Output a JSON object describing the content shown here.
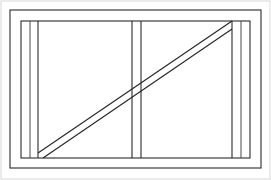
{
  "figure": {
    "title": "Braced rectangular frame elevation",
    "caption": "",
    "type": "line-drawing",
    "background_color": "#ffffff",
    "line_color": "#2b2b2b",
    "soft_line_color": "#4a4a4a",
    "page_border_color": "#d8d8d8",
    "canvas": {
      "width": 271,
      "height": 180
    }
  },
  "geometry": {
    "page_border": {
      "x": 1,
      "y": 1,
      "width": 269,
      "height": 178
    },
    "outer_frame": {
      "x": 10,
      "y": 10,
      "width": 251,
      "height": 158
    },
    "inner_frame": {
      "x": 21,
      "y": 21,
      "width": 229,
      "height": 137
    },
    "left_stud": {
      "x1": 38,
      "y1": 21,
      "x2": 38,
      "y2": 158
    },
    "left_stud_inner": {
      "x1": 30,
      "y1": 21,
      "x2": 30,
      "y2": 158
    },
    "middle_stud_left": {
      "x1": 132,
      "y1": 21,
      "x2": 132,
      "y2": 158
    },
    "middle_stud_right": {
      "x1": 141,
      "y1": 21,
      "x2": 141,
      "y2": 158
    },
    "right_stud": {
      "x1": 232,
      "y1": 21,
      "x2": 232,
      "y2": 158
    },
    "right_stud_inner": {
      "x1": 241,
      "y1": 21,
      "x2": 241,
      "y2": 158
    },
    "brace_upper_edge": {
      "x1": 38,
      "y1": 153,
      "x2": 232,
      "y2": 21
    },
    "brace_lower_edge": {
      "x1": 43,
      "y1": 158,
      "x2": 232,
      "y2": 29
    }
  },
  "members": [
    {
      "id": "outer-frame",
      "label": "Outer frame",
      "kind": "rectangle"
    },
    {
      "id": "inner-frame",
      "label": "Inner frame",
      "kind": "rectangle"
    },
    {
      "id": "top-rail",
      "label": "Top rail",
      "kind": "horizontal"
    },
    {
      "id": "bottom-rail",
      "label": "Bottom rail",
      "kind": "horizontal"
    },
    {
      "id": "left-stud",
      "label": "Left stud",
      "kind": "vertical"
    },
    {
      "id": "middle-stud",
      "label": "Middle stud",
      "kind": "vertical"
    },
    {
      "id": "right-stud",
      "label": "Right stud",
      "kind": "vertical"
    },
    {
      "id": "diagonal-brace",
      "label": "Diagonal brace",
      "kind": "diagonal"
    }
  ]
}
